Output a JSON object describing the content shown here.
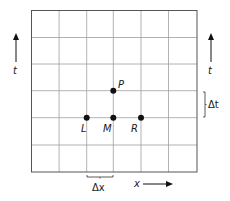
{
  "diagram": {
    "type": "finite-difference-grid",
    "grid": {
      "columns": 6,
      "rows": 6,
      "left": 31.5,
      "top": 10.5,
      "right": 197,
      "bottom": 172
    },
    "points": [
      {
        "id": "P",
        "label": "P",
        "x": 113.3,
        "y": 90.7
      },
      {
        "id": "L",
        "label": "L",
        "x": 86.7,
        "y": 117.7
      },
      {
        "id": "M",
        "label": "M",
        "x": 113.3,
        "y": 117.7
      },
      {
        "id": "R",
        "label": "R",
        "x": 141,
        "y": 117.7
      }
    ],
    "axes": {
      "x_label": "x",
      "t_label_left": "t",
      "t_label_right": "t"
    },
    "spacing": {
      "dx_label": "Δx",
      "dt_label": "Δt"
    },
    "colors": {
      "grid": "#9a9a9a",
      "border": "#555555",
      "ink": "#1a1a1a"
    }
  }
}
